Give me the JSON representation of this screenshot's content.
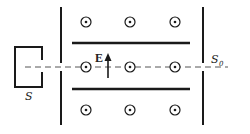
{
  "diagram": {
    "type": "velocity-selector",
    "labels": {
      "source": "S",
      "exit_slit_main": "S",
      "exit_slit_sub": "0",
      "field": "E"
    },
    "field_symbol": "dot-in-circle (B out of page)",
    "colors": {
      "ink": "#1a1a1a",
      "background": "#ffffff",
      "dashed_line": "#555555"
    }
  }
}
